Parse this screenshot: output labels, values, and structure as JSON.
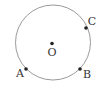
{
  "diagram": {
    "type": "circle-with-points",
    "circle": {
      "cx": 53,
      "cy": 42.5,
      "r": 37.5,
      "stroke": "#9a9a9a"
    },
    "points": [
      {
        "id": "O",
        "label": "O",
        "x": 52,
        "y": 43.5,
        "label_x": 52,
        "label_y": 56,
        "anchor": "middle"
      },
      {
        "id": "A",
        "label": "A",
        "x": 26,
        "y": 69,
        "label_x": 20,
        "label_y": 77,
        "anchor": "middle"
      },
      {
        "id": "B",
        "label": "B",
        "x": 80,
        "y": 69,
        "label_x": 87,
        "label_y": 78,
        "anchor": "middle"
      },
      {
        "id": "C",
        "label": "C",
        "x": 86,
        "y": 28,
        "label_x": 92,
        "label_y": 25,
        "anchor": "middle"
      }
    ],
    "point_color": "#222222",
    "label_color": "#333333"
  }
}
